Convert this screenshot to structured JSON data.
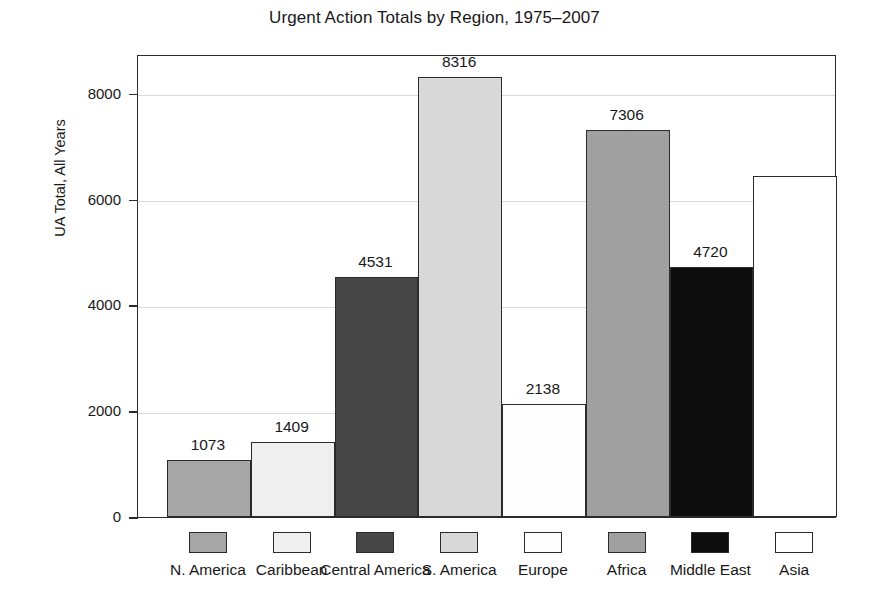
{
  "chart_data": {
    "type": "bar",
    "title": "Urgent Action Totals by Region, 1975–2007",
    "xlabel": "",
    "ylabel": "UA Total, All Years",
    "ylim": [
      0,
      8750
    ],
    "grid": true,
    "legend_position": "bottom",
    "yticks": [
      "0",
      "2000",
      "4000",
      "6000",
      "8000"
    ],
    "ytick_values": [
      0,
      2000,
      4000,
      6000,
      8000
    ],
    "categories": [
      "N. America",
      "Caribbean",
      "Central America",
      "S. America",
      "Europe",
      "Africa",
      "Middle East",
      "Asia"
    ],
    "values": [
      1073,
      1409,
      4531,
      8316,
      2138,
      7306,
      4720,
      6436
    ],
    "value_labels": [
      "1073",
      "1409",
      "4531",
      "8316",
      "2138",
      "7306",
      "4720",
      "6436"
    ],
    "colors": [
      "#a6a6a6",
      "#efefef",
      "#474747",
      "#d8d8d8",
      "#fdfdfd",
      "#a0a0a0",
      "#0d0d0d",
      "#ffffff"
    ],
    "bar_edge_color": "#2b2b2b",
    "grid_color": "#d9d9d9",
    "text_color": "#181818",
    "background": "#ffffff"
  }
}
